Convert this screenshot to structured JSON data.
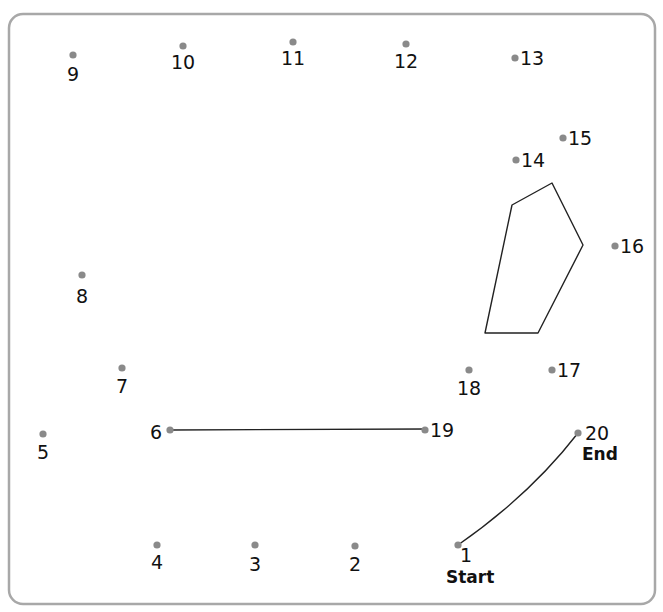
{
  "puzzle": {
    "title": "Connect the dots",
    "colors": {
      "border": "#a8a8a8",
      "dot": "#8a8a8a",
      "text": "#111111",
      "line": "#222222"
    },
    "dots": [
      {
        "n": "1",
        "x": 458,
        "y": 545,
        "lx": 466,
        "ly": 562,
        "anchor": "middle",
        "note": "Start"
      },
      {
        "n": "2",
        "x": 355,
        "y": 546,
        "lx": 355,
        "ly": 571,
        "anchor": "middle"
      },
      {
        "n": "3",
        "x": 255,
        "y": 545,
        "lx": 255,
        "ly": 571,
        "anchor": "middle"
      },
      {
        "n": "4",
        "x": 157,
        "y": 545,
        "lx": 157,
        "ly": 569,
        "anchor": "middle"
      },
      {
        "n": "5",
        "x": 43,
        "y": 434,
        "lx": 43,
        "ly": 459,
        "anchor": "middle"
      },
      {
        "n": "6",
        "x": 170,
        "y": 430,
        "lx": 156,
        "ly": 439,
        "anchor": "middle"
      },
      {
        "n": "7",
        "x": 122,
        "y": 368,
        "lx": 122,
        "ly": 393,
        "anchor": "middle"
      },
      {
        "n": "8",
        "x": 82,
        "y": 275,
        "lx": 82,
        "ly": 303,
        "anchor": "middle"
      },
      {
        "n": "9",
        "x": 73,
        "y": 55,
        "lx": 73,
        "ly": 81,
        "anchor": "middle"
      },
      {
        "n": "10",
        "x": 183,
        "y": 46,
        "lx": 183,
        "ly": 69,
        "anchor": "middle"
      },
      {
        "n": "11",
        "x": 293,
        "y": 42,
        "lx": 293,
        "ly": 65,
        "anchor": "middle"
      },
      {
        "n": "12",
        "x": 406,
        "y": 44,
        "lx": 406,
        "ly": 68,
        "anchor": "middle"
      },
      {
        "n": "13",
        "x": 515,
        "y": 58,
        "lx": 520,
        "ly": 65,
        "anchor": "start"
      },
      {
        "n": "14",
        "x": 516,
        "y": 160,
        "lx": 521,
        "ly": 167,
        "anchor": "start"
      },
      {
        "n": "15",
        "x": 563,
        "y": 138,
        "lx": 568,
        "ly": 145,
        "anchor": "start"
      },
      {
        "n": "16",
        "x": 615,
        "y": 246,
        "lx": 620,
        "ly": 253,
        "anchor": "start"
      },
      {
        "n": "17",
        "x": 552,
        "y": 370,
        "lx": 557,
        "ly": 377,
        "anchor": "start"
      },
      {
        "n": "18",
        "x": 469,
        "y": 370,
        "lx": 469,
        "ly": 395,
        "anchor": "middle"
      },
      {
        "n": "19",
        "x": 425,
        "y": 430,
        "lx": 430,
        "ly": 437,
        "anchor": "start"
      },
      {
        "n": "20",
        "x": 578,
        "y": 433,
        "lx": 585,
        "ly": 440,
        "anchor": "start",
        "note": "End"
      }
    ],
    "start_label": "Start",
    "end_label": "End",
    "drawn_lines": [
      {
        "name": "line-6-19",
        "d": "M170,430 L425,429"
      },
      {
        "name": "line-1-20",
        "d": "M458,545 Q530,495 578,433"
      }
    ],
    "shape_polygon": "512,205 552,183 583,245 538,333 485,333"
  }
}
